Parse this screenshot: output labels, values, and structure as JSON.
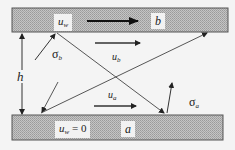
{
  "diagram": {
    "top_wall": {
      "velocity_label": "u",
      "velocity_sub": "w",
      "name": "b"
    },
    "bottom_wall": {
      "velocity_label": "u",
      "velocity_sub": "w",
      "velocity_value": " = 0",
      "name": "a"
    },
    "gap_label": "h",
    "sigma_b": {
      "symbol": "σ",
      "sub": "b"
    },
    "sigma_a": {
      "symbol": "σ",
      "sub": "a"
    },
    "u_b": {
      "symbol": "u",
      "sub": "b"
    },
    "u_a": {
      "symbol": "u",
      "sub": "a"
    },
    "colors": {
      "wall_fill": "#b8b8b8",
      "wall_border": "#555555",
      "line": "#333333",
      "background": "#f4f4f4"
    }
  }
}
